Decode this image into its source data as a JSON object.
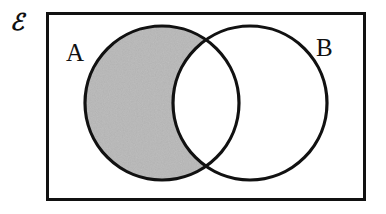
{
  "figure": {
    "kind": "venn-diagram",
    "width": 386,
    "height": 214,
    "background_color": "#ffffff",
    "stroke_color": "#111111",
    "shade_color": "#c8c8c8",
    "caption_region": "A minus B shaded"
  },
  "universal_set": {
    "symbol": "ℰ",
    "name": "universal-set",
    "description": "script E denoting the universal set",
    "rect": {
      "x": 46,
      "y": 12,
      "width": 320,
      "height": 189,
      "border_width": 3,
      "border_color": "#111111",
      "fill": "#ffffff"
    }
  },
  "sets": [
    {
      "label": "A",
      "name": "set-a",
      "cx": 162,
      "cy": 103,
      "r": 77,
      "stroke_width": 3,
      "stroke_color": "#111111",
      "fill": "none",
      "label_x": 66,
      "label_y": 40
    },
    {
      "label": "B",
      "name": "set-b",
      "cx": 250,
      "cy": 103,
      "r": 77,
      "stroke_width": 3,
      "stroke_color": "#111111",
      "fill": "none",
      "label_x": 316,
      "label_y": 35
    }
  ],
  "shaded_regions": [
    {
      "name": "a-minus-b",
      "expression": "A \\ B",
      "fill_color": "#c8c8c8",
      "texture": "speckled-gray",
      "shaded": true
    },
    {
      "name": "a-intersect-b",
      "expression": "A ∩ B",
      "fill_color": "#ffffff",
      "texture": "none",
      "shaded": false
    },
    {
      "name": "b-minus-a",
      "expression": "B \\ A",
      "fill_color": "#ffffff",
      "texture": "none",
      "shaded": false
    },
    {
      "name": "outside-both",
      "expression": "ℰ \\ (A ∪ B)",
      "fill_color": "#ffffff",
      "texture": "none",
      "shaded": false
    }
  ]
}
